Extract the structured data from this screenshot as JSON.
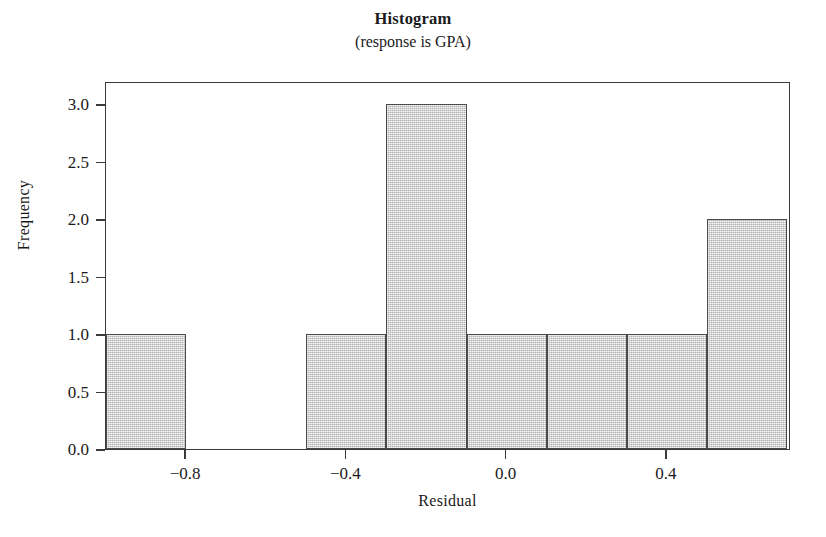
{
  "chart_data": {
    "type": "bar",
    "title": "Histogram",
    "subtitle": "(response is GPA)",
    "xlabel": "Residual",
    "ylabel": "Frequency",
    "xlim": [
      -1.0,
      0.71
    ],
    "ylim": [
      0.0,
      3.2
    ],
    "grid": false,
    "legend": null,
    "bin_width": 0.2,
    "bins": [
      {
        "label": "-1.0 to -0.8",
        "x0": -1.0,
        "x1": -0.8,
        "value": 1
      },
      {
        "label": "-0.8 to -0.6",
        "x0": -0.8,
        "x1": -0.6,
        "value": 0
      },
      {
        "label": "-0.6 to -0.5",
        "x0": -0.6,
        "x1": -0.5,
        "value": 0
      },
      {
        "label": "-0.5 to -0.3",
        "x0": -0.5,
        "x1": -0.3,
        "value": 1
      },
      {
        "label": "-0.3 to -0.1",
        "x0": -0.3,
        "x1": -0.1,
        "value": 3
      },
      {
        "label": "-0.1 to 0.1",
        "x0": -0.1,
        "x1": 0.1,
        "value": 1
      },
      {
        "label": "0.1 to 0.3",
        "x0": 0.1,
        "x1": 0.3,
        "value": 1
      },
      {
        "label": "0.3 to 0.5",
        "x0": 0.3,
        "x1": 0.5,
        "value": 1
      },
      {
        "label": "0.5 to 0.7",
        "x0": 0.5,
        "x1": 0.7,
        "value": 2
      }
    ],
    "categories": [
      "-1.0 to -0.8",
      "-0.8 to -0.6",
      "-0.6 to -0.5",
      "-0.5 to -0.3",
      "-0.3 to -0.1",
      "-0.1 to 0.1",
      "0.1 to 0.3",
      "0.3 to 0.5",
      "0.5 to 0.7"
    ],
    "values": [
      1,
      0,
      0,
      1,
      3,
      1,
      1,
      1,
      2
    ],
    "x_ticks": [
      {
        "value": -0.8,
        "label": "−0.8"
      },
      {
        "value": -0.4,
        "label": "−0.4"
      },
      {
        "value": 0.0,
        "label": "0.0"
      },
      {
        "value": 0.4,
        "label": "0.4"
      }
    ],
    "y_ticks": [
      {
        "value": 0.0,
        "label": "0.0"
      },
      {
        "value": 0.5,
        "label": "0.5"
      },
      {
        "value": 1.0,
        "label": "1.0"
      },
      {
        "value": 1.5,
        "label": "1.5"
      },
      {
        "value": 2.0,
        "label": "2.0"
      },
      {
        "value": 2.5,
        "label": "2.5"
      },
      {
        "value": 3.0,
        "label": "3.0"
      }
    ],
    "colors": {
      "bar_fill": "#c9c9c9",
      "bar_edge": "#4a4a4a",
      "axis": "#3a3a3a",
      "text": "#1a1a1a",
      "background": "#ffffff"
    }
  }
}
